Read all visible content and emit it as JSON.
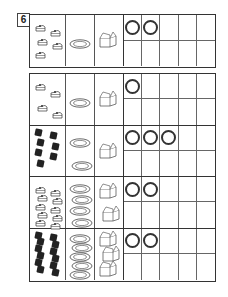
{
  "exercise": {
    "number": "6",
    "circles_per_row": 5
  },
  "example_grid": {
    "rows": [
      {
        "item": "cake-slice",
        "item_count": 5,
        "plates": 1,
        "boxes": 1,
        "circles_drawn": 2
      }
    ]
  },
  "main_grid": {
    "rows": [
      {
        "item": "cake-slice",
        "item_count": 4,
        "plates": 1,
        "boxes": 1,
        "circles_drawn": 1
      },
      {
        "item": "chocolate",
        "item_count": 7,
        "plates": 2,
        "boxes": 1,
        "circles_drawn": 3
      },
      {
        "item": "cake-slice",
        "item_count": 10,
        "plates": 4,
        "boxes": 2,
        "circles_drawn": 2
      },
      {
        "item": "chocolate",
        "item_count": 12,
        "plates": 5,
        "boxes": 3,
        "circles_drawn": 2
      }
    ]
  },
  "colors": {
    "line": "#333333",
    "fill_dark": "#222222",
    "background": "#ffffff"
  }
}
